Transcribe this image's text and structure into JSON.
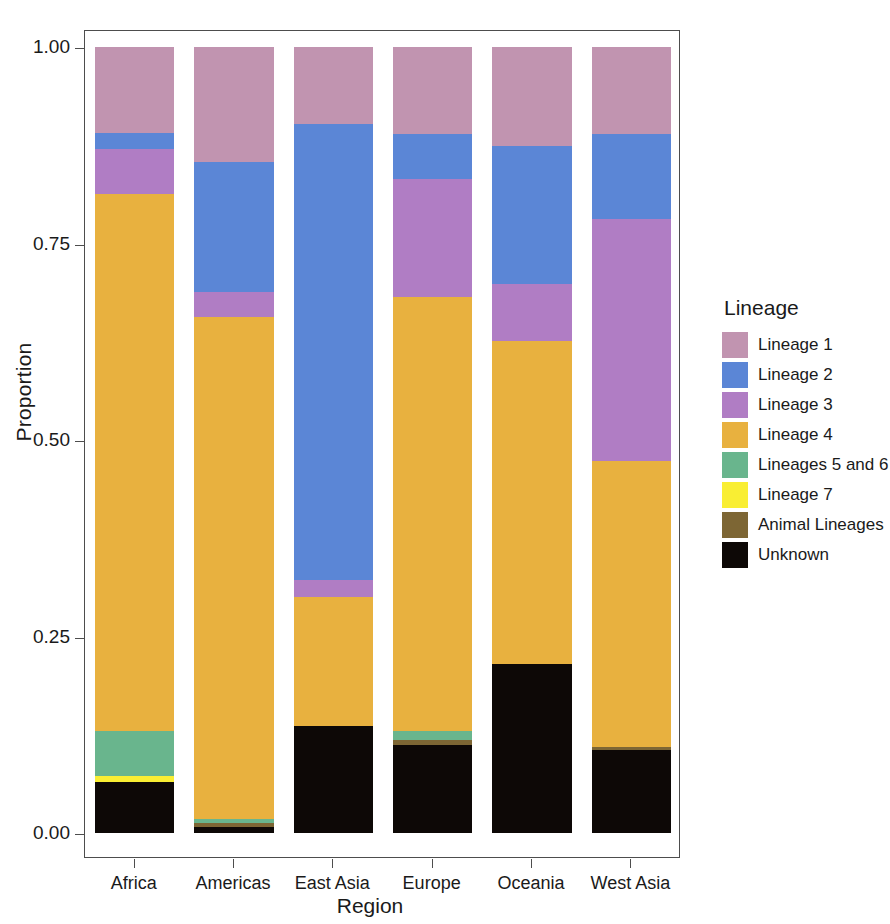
{
  "chart_data": {
    "type": "bar",
    "stacked": true,
    "normalized": true,
    "title": "",
    "xlabel": "Region",
    "ylabel": "Proportion",
    "legend_title": "Lineage",
    "legend_position": "right",
    "grid": false,
    "ylim": [
      0,
      1
    ],
    "yticks": [
      0.0,
      0.25,
      0.5,
      0.75,
      1.0
    ],
    "ytick_labels": [
      "0.00",
      "0.25",
      "0.50",
      "0.75",
      "1.00"
    ],
    "categories": [
      "Africa",
      "Americas",
      "East Asia",
      "Europe",
      "Oceania",
      "West Asia"
    ],
    "series": [
      {
        "name": "Lineage 1",
        "color": "#c194b0",
        "values": [
          0.11,
          0.146,
          0.098,
          0.111,
          0.126,
          0.111
        ]
      },
      {
        "name": "Lineage 2",
        "color": "#5b86d6",
        "values": [
          0.02,
          0.166,
          0.58,
          0.057,
          0.175,
          0.108
        ]
      },
      {
        "name": "Lineage 3",
        "color": "#b07dc4",
        "values": [
          0.057,
          0.032,
          0.022,
          0.15,
          0.073,
          0.308
        ]
      },
      {
        "name": "Lineage 4",
        "color": "#e8b13f",
        "values": [
          0.683,
          0.638,
          0.164,
          0.552,
          0.411,
          0.363
        ]
      },
      {
        "name": "Lineages 5 and 6",
        "color": "#69b58d",
        "values": [
          0.058,
          0.005,
          0.0,
          0.012,
          0.0,
          0.0
        ]
      },
      {
        "name": "Lineage 7",
        "color": "#f9ee33",
        "values": [
          0.007,
          0.0,
          0.0,
          0.0,
          0.0,
          0.0
        ]
      },
      {
        "name": "Animal Lineages",
        "color": "#7d6634",
        "values": [
          0.0,
          0.005,
          0.0,
          0.006,
          0.0,
          0.005
        ]
      },
      {
        "name": "Unknown",
        "color": "#0d0806",
        "values": [
          0.065,
          0.008,
          0.136,
          0.112,
          0.215,
          0.105
        ]
      }
    ]
  },
  "axes": {
    "ylabel": "Proportion",
    "xlabel": "Region",
    "ytick_labels": [
      "1.00",
      "0.75",
      "0.50",
      "0.25",
      "0.00"
    ],
    "xtick_labels": [
      "Africa",
      "Americas",
      "East Asia",
      "Europe",
      "Oceania",
      "West Asia"
    ]
  },
  "legend": {
    "title": "Lineage",
    "items": [
      {
        "label": "Lineage 1",
        "color": "#c194b0"
      },
      {
        "label": "Lineage 2",
        "color": "#5b86d6"
      },
      {
        "label": "Lineage 3",
        "color": "#b07dc4"
      },
      {
        "label": "Lineage 4",
        "color": "#e8b13f"
      },
      {
        "label": "Lineages 5 and 6",
        "color": "#69b58d"
      },
      {
        "label": "Lineage 7",
        "color": "#f9ee33"
      },
      {
        "label": "Animal Lineages",
        "color": "#7d6634"
      },
      {
        "label": "Unknown",
        "color": "#0d0806"
      }
    ]
  }
}
